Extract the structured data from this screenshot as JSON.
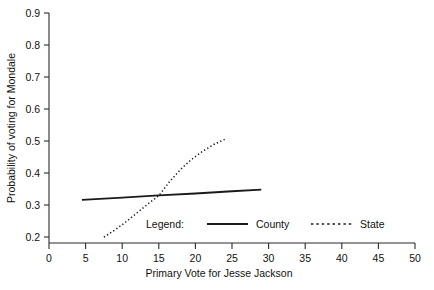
{
  "chart_data": {
    "type": "line",
    "title": "",
    "xlabel": "Primary Vote for Jesse Jackson",
    "ylabel": "Probability of voting for Mondale",
    "xlim": [
      0,
      50
    ],
    "ylim": [
      0.2,
      0.9
    ],
    "xticks": [
      0,
      5,
      10,
      15,
      20,
      25,
      30,
      35,
      40,
      45,
      50
    ],
    "xtick_labels": [
      "0",
      "5",
      "10",
      "15",
      "20",
      "25",
      "30",
      "35",
      "40",
      "45",
      "50"
    ],
    "yticks": [
      0.2,
      0.3,
      0.4,
      0.5,
      0.6,
      0.7,
      0.8,
      0.9
    ],
    "ytick_labels": [
      "0.2",
      "0.3",
      "0.4",
      "0.5",
      "0.6",
      "0.7",
      "0.8",
      "0.9"
    ],
    "grid": false,
    "legend_position": "inside-bottom-center",
    "legend_title": "Legend:",
    "series": [
      {
        "name": "County",
        "style": "solid",
        "color": "#1a1a1a",
        "x": [
          4.5,
          10,
          15,
          20,
          25,
          29
        ],
        "y": [
          0.316,
          0.323,
          0.33,
          0.336,
          0.343,
          0.348
        ]
      },
      {
        "name": "State",
        "style": "dotted",
        "color": "#1a1a1a",
        "x": [
          7.5,
          9,
          10.5,
          12,
          13.5,
          15,
          16.5,
          18,
          19.5,
          21,
          22.5,
          24
        ],
        "y": [
          0.2,
          0.222,
          0.247,
          0.275,
          0.303,
          0.329,
          0.374,
          0.412,
          0.443,
          0.468,
          0.489,
          0.505
        ]
      }
    ]
  },
  "legend": {
    "label": "Legend:",
    "entries": [
      {
        "name": "County",
        "style": "solid"
      },
      {
        "name": "State",
        "style": "dotted"
      }
    ]
  }
}
